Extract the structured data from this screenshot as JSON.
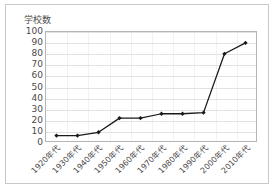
{
  "chart_data": {
    "type": "line",
    "title": "学校数",
    "xlabel": "",
    "ylabel": "学校数",
    "categories": [
      "1920年代",
      "1930年代",
      "1940年代",
      "1950年代",
      "1960年代",
      "1970年代",
      "1980年代",
      "1990年代",
      "2000年代",
      "2010年代"
    ],
    "values": [
      5,
      5,
      8,
      21,
      21,
      25,
      25,
      26,
      80,
      90
    ],
    "series": [
      {
        "name": "学校数",
        "values": [
          5,
          5,
          8,
          21,
          21,
          25,
          25,
          26,
          80,
          90
        ]
      }
    ],
    "ylim": [
      0,
      100
    ],
    "yticks": [
      0,
      10,
      20,
      30,
      40,
      50,
      60,
      70,
      80,
      90,
      100
    ],
    "ytick_labels": [
      "0",
      "10",
      "20",
      "30",
      "40",
      "50",
      "60",
      "70",
      "80",
      "90",
      "100"
    ],
    "grid": true,
    "legend": false,
    "legend_position": "none",
    "line_color": "#1a1a1a",
    "marker_color": "#1a1a1a",
    "marker": "diamond",
    "plot_background": "#ffffff",
    "grid_color": "#e2e2e2",
    "axis_color": "#b5b5b5",
    "border_color": "#c8c8c8",
    "text_color": "#4a4a4a",
    "xtick_rotation": -45
  }
}
